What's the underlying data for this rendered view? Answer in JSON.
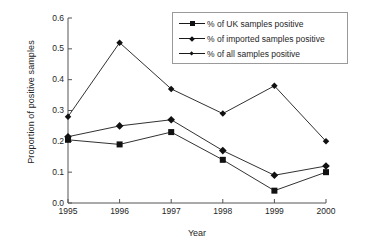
{
  "chart_data": {
    "type": "line",
    "title": "",
    "xlabel": "Year",
    "ylabel": "Proportion of positive samples",
    "categories": [
      "1995",
      "1996",
      "1997",
      "1998",
      "1999",
      "2000"
    ],
    "x": [
      1995,
      1996,
      1997,
      1998,
      1999,
      2000
    ],
    "xlim": [
      1995,
      2000
    ],
    "ylim": [
      0.0,
      0.6
    ],
    "yticks": [
      "0.0",
      "0.1",
      "0.2",
      "0.3",
      "0.4",
      "0.5",
      "0.6"
    ],
    "ytick_values": [
      0.0,
      0.1,
      0.2,
      0.3,
      0.4,
      0.5,
      0.6
    ],
    "grid": false,
    "legend_position": "top-right",
    "series": [
      {
        "name": "% of UK samples positive",
        "marker": "square",
        "values": [
          0.205,
          0.19,
          0.23,
          0.14,
          0.04,
          0.1
        ]
      },
      {
        "name": "% of imported samples positive",
        "marker": "diamond",
        "values": [
          0.215,
          0.25,
          0.27,
          0.17,
          0.09,
          0.12
        ]
      },
      {
        "name": "% of all samples positive",
        "marker": "small-diamond",
        "values": [
          0.28,
          0.52,
          0.37,
          0.29,
          0.38,
          0.2
        ]
      }
    ]
  },
  "axes": {
    "x_title": "Year",
    "y_title": "Proportion of positive samples"
  },
  "legend": {
    "items": [
      {
        "label": "% of UK samples positive",
        "marker": "square"
      },
      {
        "label": "% of imported samples positive",
        "marker": "diamond"
      },
      {
        "label": "% of all samples positive",
        "marker": "small-diamond"
      }
    ]
  },
  "colors": {
    "line": "#1a1a1a",
    "marker": "#111111",
    "axis": "#555555",
    "legend_border": "#9a9a9a",
    "background": "#ffffff"
  }
}
